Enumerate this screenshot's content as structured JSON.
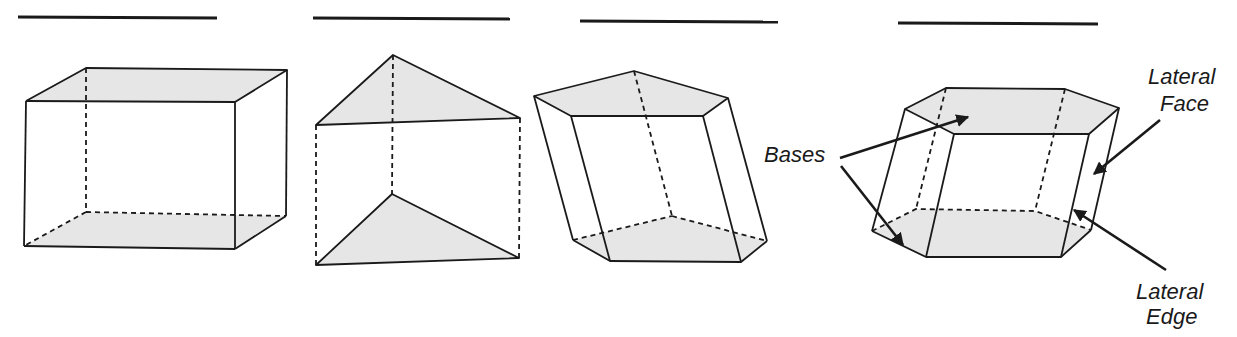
{
  "figures": [
    {
      "name": "rectangular-prism",
      "answer_blank": ""
    },
    {
      "name": "triangular-prism",
      "answer_blank": ""
    },
    {
      "name": "pentagonal-prism",
      "answer_blank": ""
    },
    {
      "name": "hexagonal-prism",
      "answer_blank": ""
    }
  ],
  "labels": {
    "bases": "Bases",
    "lateral_face_line1": "Lateral",
    "lateral_face_line2": "Face",
    "lateral_edge_line1": "Lateral",
    "lateral_edge_line2": "Edge"
  },
  "colors": {
    "line": "#1a1a1a",
    "base_fill": "#e6e6e6",
    "background": "#ffffff"
  }
}
